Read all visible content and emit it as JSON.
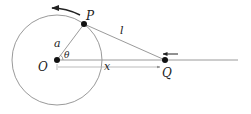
{
  "diagram": {
    "type": "crank-slider mechanism",
    "labels": {
      "P": "P",
      "O": "O",
      "Q": "Q",
      "a": "a",
      "l": "l",
      "theta": "θ",
      "x": "x"
    },
    "colors": {
      "circle": "#9a9a9a",
      "lines": "#9a9a9a",
      "points": "#111111",
      "arrows": "#222222"
    },
    "elements": [
      {
        "name": "circle",
        "center": "O",
        "radius_label": "a"
      },
      {
        "name": "crank",
        "from": "O",
        "to": "P",
        "label": "a"
      },
      {
        "name": "connecting-rod",
        "from": "P",
        "to": "Q",
        "label": "l"
      },
      {
        "name": "horizontal-axis",
        "through": [
          "O",
          "Q"
        ]
      },
      {
        "name": "distance-x",
        "from": "O",
        "to": "Q",
        "label": "x"
      },
      {
        "name": "angle-theta",
        "at": "O",
        "label": "θ"
      },
      {
        "name": "rotation-arrow",
        "near": "P",
        "direction": "counterclockwise"
      },
      {
        "name": "slider-arrow",
        "near": "Q",
        "direction": "left"
      }
    ]
  }
}
